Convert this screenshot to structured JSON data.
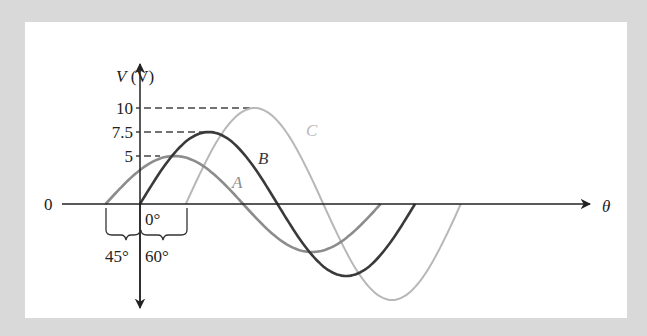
{
  "figure": {
    "y_axis_label_var": "V",
    "y_axis_label_unit": "(V)",
    "x_axis_label": "θ",
    "origin_label": "0",
    "tick_labels": {
      "v10": "10",
      "v75": "7.5",
      "v5": "5"
    },
    "phase_labels": {
      "zero": "0°",
      "lead": "45°",
      "lag": "60°"
    },
    "curve_labels": {
      "A": "A",
      "B": "B",
      "C": "C"
    },
    "colors": {
      "A": "#8c8c8c",
      "B": "#3a3a3a",
      "C": "#b8b8b8",
      "axis": "#222222"
    }
  },
  "chart_data": {
    "type": "line",
    "title": "",
    "xlabel": "θ",
    "ylabel": "V (V)",
    "series": [
      {
        "name": "A",
        "amplitude": 5,
        "phase_deg": 45,
        "description": "v = 5 sin(θ + 45°), leads B by 45°"
      },
      {
        "name": "B",
        "amplitude": 7.5,
        "phase_deg": 0,
        "description": "v = 7.5 sin(θ)"
      },
      {
        "name": "C",
        "amplitude": 10,
        "phase_deg": -60,
        "description": "v = 10 sin(θ − 60°), lags B by 60°"
      }
    ],
    "y_ticks": [
      5,
      7.5,
      10
    ],
    "annotations": [
      "0°",
      "45°",
      "60°"
    ]
  }
}
